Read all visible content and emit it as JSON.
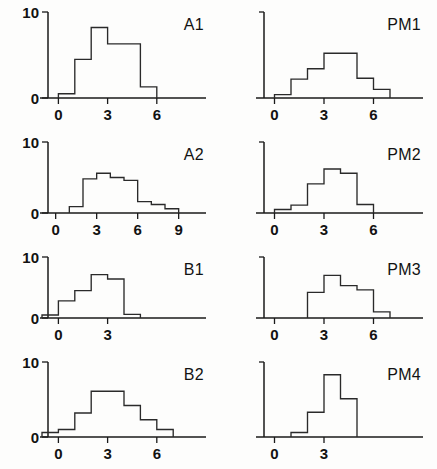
{
  "figure": {
    "background_color": "#fdfdfc",
    "line_color": "#2a2a2a",
    "axis_color": "#1a1a1a",
    "columns": 2,
    "rows": 4
  },
  "chart_data": [
    {
      "type": "bar",
      "title": "A1",
      "xlabel": "",
      "ylabel": "",
      "grid": false,
      "legend": null,
      "xticks": [
        0,
        3,
        6
      ],
      "xtick_labels": [
        "0",
        "3",
        "6"
      ],
      "yticks": [
        0,
        10
      ],
      "ytick_labels": [
        "0",
        "10"
      ],
      "ylim": [
        0,
        10
      ],
      "xlim": [
        -1,
        9
      ],
      "bin_width": 1,
      "bin_starts": [
        0,
        1,
        2,
        3,
        4,
        5
      ],
      "categories": [
        "0",
        "1",
        "2",
        "3",
        "4",
        "5"
      ],
      "values": [
        0.5,
        4.5,
        8.2,
        6.3,
        6.3,
        1.3
      ]
    },
    {
      "type": "bar",
      "title": "PM1",
      "xlabel": "",
      "ylabel": "",
      "grid": false,
      "legend": null,
      "xticks": [
        0,
        3,
        6
      ],
      "xtick_labels": [
        "0",
        "3",
        "6"
      ],
      "yticks": [],
      "ytick_labels": [],
      "ylim": [
        0,
        10
      ],
      "xlim": [
        -1,
        9
      ],
      "bin_width": 1,
      "bin_starts": [
        0,
        1,
        2,
        3,
        4,
        5,
        6
      ],
      "categories": [
        "0",
        "1",
        "2",
        "3",
        "4",
        "5",
        "6"
      ],
      "values": [
        0.4,
        2.2,
        3.4,
        5.2,
        5.2,
        2.3,
        1.0
      ]
    },
    {
      "type": "bar",
      "title": "A2",
      "xlabel": "",
      "ylabel": "",
      "grid": false,
      "legend": null,
      "xticks": [
        0,
        3,
        6,
        9
      ],
      "xtick_labels": [
        "0",
        "3",
        "6",
        "9"
      ],
      "yticks": [
        0,
        10
      ],
      "ytick_labels": [
        "0",
        "10"
      ],
      "ylim": [
        0,
        10
      ],
      "xlim": [
        -1,
        11
      ],
      "bin_width": 1,
      "bin_starts": [
        1,
        2,
        3,
        4,
        5,
        6,
        7,
        8
      ],
      "categories": [
        "1",
        "2",
        "3",
        "4",
        "5",
        "6",
        "7",
        "8"
      ],
      "values": [
        0.9,
        4.8,
        5.6,
        5.0,
        4.6,
        1.6,
        1.2,
        0.6
      ]
    },
    {
      "type": "bar",
      "title": "PM2",
      "xlabel": "",
      "ylabel": "",
      "grid": false,
      "legend": null,
      "xticks": [
        0,
        3,
        6
      ],
      "xtick_labels": [
        "0",
        "3",
        "6"
      ],
      "yticks": [],
      "ytick_labels": [],
      "ylim": [
        0,
        10
      ],
      "xlim": [
        -1,
        9
      ],
      "bin_width": 1,
      "bin_starts": [
        0,
        1,
        2,
        3,
        4,
        5
      ],
      "categories": [
        "0",
        "1",
        "2",
        "3",
        "4",
        "5"
      ],
      "values": [
        0.5,
        1.1,
        4.1,
        6.2,
        5.6,
        1.2
      ]
    },
    {
      "type": "bar",
      "title": "B1",
      "xlabel": "",
      "ylabel": "",
      "grid": false,
      "legend": null,
      "xticks": [
        0,
        3
      ],
      "xtick_labels": [
        "0",
        "3"
      ],
      "yticks": [
        0,
        10
      ],
      "ytick_labels": [
        "0",
        "10"
      ],
      "ylim": [
        0,
        10
      ],
      "xlim": [
        -1,
        9
      ],
      "bin_width": 1,
      "bin_starts": [
        -1,
        0,
        1,
        2,
        3,
        4
      ],
      "categories": [
        "-1",
        "0",
        "1",
        "2",
        "3",
        "4"
      ],
      "values": [
        0.5,
        2.8,
        4.5,
        7.1,
        6.4,
        0.6
      ]
    },
    {
      "type": "bar",
      "title": "PM3",
      "xlabel": "",
      "ylabel": "",
      "grid": false,
      "legend": null,
      "xticks": [
        0,
        3,
        6
      ],
      "xtick_labels": [
        "0",
        "3",
        "6"
      ],
      "yticks": [],
      "ytick_labels": [],
      "ylim": [
        0,
        10
      ],
      "xlim": [
        -1,
        9
      ],
      "bin_width": 1,
      "bin_starts": [
        2,
        3,
        4,
        5,
        6
      ],
      "categories": [
        "2",
        "3",
        "4",
        "5",
        "6"
      ],
      "values": [
        4.2,
        7.0,
        5.3,
        4.6,
        1.0
      ]
    },
    {
      "type": "bar",
      "title": "B2",
      "xlabel": "",
      "ylabel": "",
      "grid": false,
      "legend": null,
      "xticks": [
        0,
        3,
        6
      ],
      "xtick_labels": [
        "0",
        "3",
        "6"
      ],
      "yticks": [
        0,
        10
      ],
      "ytick_labels": [
        "0",
        "10"
      ],
      "ylim": [
        0,
        10
      ],
      "xlim": [
        -1,
        9
      ],
      "bin_width": 1,
      "bin_starts": [
        -1,
        0,
        1,
        2,
        3,
        4,
        5,
        6
      ],
      "categories": [
        "-1",
        "0",
        "1",
        "2",
        "3",
        "4",
        "5",
        "6"
      ],
      "values": [
        0.6,
        1.0,
        3.2,
        6.1,
        6.1,
        4.2,
        2.3,
        1.0
      ]
    },
    {
      "type": "bar",
      "title": "PM4",
      "xlabel": "",
      "ylabel": "",
      "grid": false,
      "legend": null,
      "xticks": [
        0,
        3
      ],
      "xtick_labels": [
        "0",
        "3"
      ],
      "yticks": [],
      "ytick_labels": [],
      "ylim": [
        0,
        10
      ],
      "xlim": [
        -1,
        9
      ],
      "bin_width": 1,
      "bin_starts": [
        1,
        2,
        3,
        4
      ],
      "categories": [
        "1",
        "2",
        "3",
        "4"
      ],
      "values": [
        0.6,
        3.3,
        8.3,
        5.1
      ]
    }
  ]
}
